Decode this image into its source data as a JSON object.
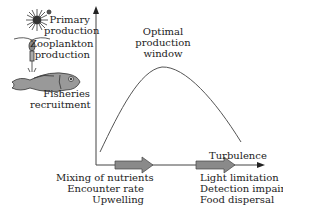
{
  "y_axis_labels": {
    "primary": [
      "Primary",
      "production"
    ],
    "zooplankton": [
      "Zooplankton",
      "production"
    ],
    "fisheries": [
      "Fisheries",
      "recruitment"
    ]
  },
  "peak_label": [
    "Optimal",
    "production",
    "window"
  ],
  "turbulence_label": "Turbulence",
  "low_effects": [
    "Mixing of nutrients",
    "Encounter rate",
    "Upwelling"
  ],
  "high_effects": [
    "Light limitation",
    "Detection impaired",
    "Food dispersal"
  ],
  "icons": [
    "phytoplankton-icon",
    "copepod-icon",
    "fish-icon"
  ],
  "colors": {
    "line": "#555555",
    "arrow_fill": "#8a8a8a",
    "arrow_stroke": "#444444"
  }
}
